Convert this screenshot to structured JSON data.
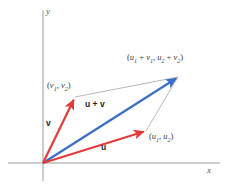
{
  "figure": {
    "background_color": "#ffffff",
    "width": 229,
    "height": 193
  },
  "axes": {
    "x_label": "x",
    "y_label": "y",
    "color": "#9a9a9a",
    "origin": {
      "x": 43,
      "y": 163
    },
    "x_axis": {
      "x1": 8,
      "y1": 163,
      "x2": 220,
      "y2": 163
    },
    "y_axis": {
      "x1": 43,
      "y1": 10,
      "x2": 43,
      "y2": 181
    }
  },
  "colors": {
    "vector_u": "#e23b3b",
    "vector_v": "#e23b3b",
    "vector_sum": "#3a6fc4",
    "construction_line": "#9a9a9a",
    "axis": "#9a9a9a",
    "text": "#2b2b2b"
  },
  "vectors": [
    {
      "name": "v",
      "label": "v",
      "color": "#e23b3b",
      "tail": {
        "x": 43,
        "y": 163
      },
      "head": {
        "x": 75,
        "y": 97
      },
      "endpoint_label": "(v1, v2)"
    },
    {
      "name": "u",
      "label": "u",
      "color": "#e23b3b",
      "tail": {
        "x": 43,
        "y": 163
      },
      "head": {
        "x": 146,
        "y": 131
      },
      "endpoint_label": "(u1, u2)"
    },
    {
      "name": "u+v",
      "label": "u + v",
      "color": "#3a6fc4",
      "tail": {
        "x": 43,
        "y": 163
      },
      "head": {
        "x": 178,
        "y": 77
      },
      "endpoint_label": "(u1 + v1, u2 + v2)"
    }
  ],
  "construction_lines": [
    {
      "name": "v-to-sum",
      "x1": 75,
      "y1": 97,
      "x2": 178,
      "y2": 77
    },
    {
      "name": "u-to-sum",
      "x1": 146,
      "y1": 131,
      "x2": 178,
      "y2": 77
    }
  ],
  "labels": {
    "axis_x": "x",
    "axis_y": "y",
    "vector_v": "v",
    "vector_u": "u",
    "vector_sum": "u + v",
    "point_v": {
      "open": "(",
      "sym1": "v",
      "sub1": "1",
      "comma": ", ",
      "sym2": "v",
      "sub2": "2",
      "close": ")"
    },
    "point_u": {
      "open": "(",
      "sym1": "u",
      "sub1": "1",
      "comma": ", ",
      "sym2": "u",
      "sub2": "2",
      "close": ")"
    },
    "point_sum": {
      "open": "(",
      "sym1": "u",
      "sub1": "1",
      "plus1": " + ",
      "sym2": "v",
      "sub2": "1",
      "comma": ", ",
      "sym3": "u",
      "sub3": "2",
      "plus2": " + ",
      "sym4": "v",
      "sub4": "2",
      "close": ")"
    }
  }
}
